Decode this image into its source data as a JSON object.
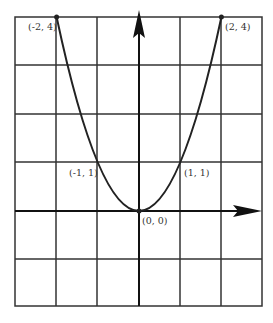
{
  "figure": {
    "grid": {
      "cols": 6,
      "rows": 6,
      "x_range": [
        -3,
        3
      ],
      "y_range": [
        -2,
        4
      ]
    },
    "curve": "y = x^2",
    "points": [
      {
        "label": "(-2, 4)",
        "x": -2,
        "y": 4
      },
      {
        "label": "(2, 4)",
        "x": 2,
        "y": 4
      },
      {
        "label": "(-1, 1)",
        "x": -1,
        "y": 1
      },
      {
        "label": "(1, 1)",
        "x": 1,
        "y": 1
      },
      {
        "label": "(0, 0)",
        "x": 0,
        "y": 0
      }
    ],
    "colors": {
      "line": "#222222",
      "grid": "#333333",
      "label": "#333333"
    }
  }
}
